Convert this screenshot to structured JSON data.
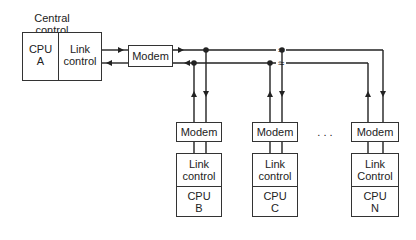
{
  "central": {
    "title_line1": "Central",
    "title_line2": "control",
    "cpu_line1": "CPU",
    "cpu_line2": "A",
    "link_line1": "Link",
    "link_line2": "control",
    "modem": "Modem"
  },
  "stations": [
    {
      "modem": "Modem",
      "link_line1": "Link",
      "link_line2": "control",
      "cpu_line1": "CPU",
      "cpu_line2": "B"
    },
    {
      "modem": "Modem",
      "link_line1": "Link",
      "link_line2": "control",
      "cpu_line1": "CPU",
      "cpu_line2": "C"
    },
    {
      "modem": "Modem",
      "link_line1": "Link",
      "link_line2": "Control",
      "cpu_line1": "CPU",
      "cpu_line2": "N"
    }
  ],
  "ellipsis": ". . .",
  "break_symbol": "≈"
}
